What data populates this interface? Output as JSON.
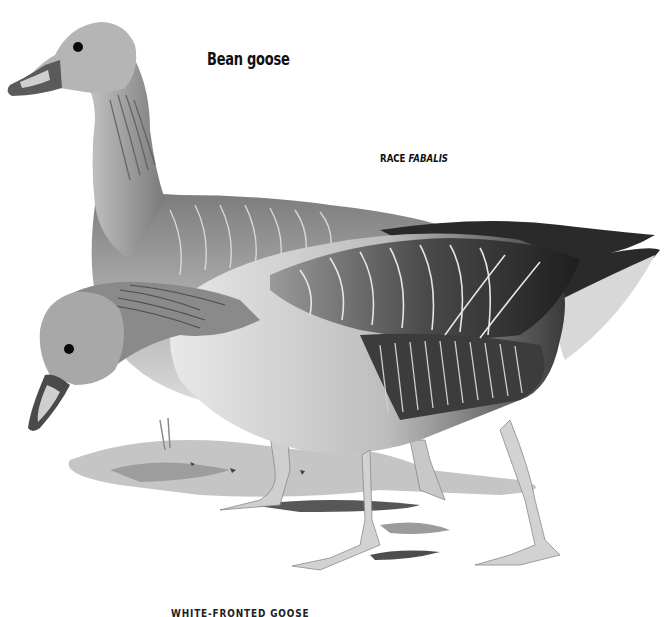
{
  "plate": {
    "title": "Bean goose",
    "race_label": "RACE",
    "race_name": "FABALIS",
    "bottom_caption": "WHITE-FRONTED GOOSE"
  },
  "illustration": {
    "subject": "Two bean geese, greyscale painting",
    "colors": {
      "background": "#ffffff",
      "dark_plumage": "#2a2a2a",
      "mid_plumage": "#6e6e6e",
      "light_plumage": "#bdbdbd",
      "pale_belly": "#e4e4e4",
      "ground": "#a8a8a8"
    }
  }
}
